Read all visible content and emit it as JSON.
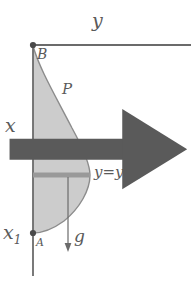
{
  "figure": {
    "background_color": "#ffffff",
    "ink_color": "#5a5a5a",
    "fill_color": "#cccccc",
    "bar_color": "#999999"
  },
  "labels": {
    "y_axis": "y",
    "x_axis": "x",
    "x_lower": "x",
    "x_lower_sub": "1",
    "point_b": "B",
    "point_a": "A",
    "curve_p": "P",
    "area_s": "S",
    "curve_equation": "y=y(x)",
    "gravity": "g"
  },
  "icons": {
    "gravity_vector_accent": "vector-arrow-icon",
    "gravity_arrow": "down-arrow-icon",
    "point_marker_a": "dot-marker-icon",
    "point_marker_b": "dot-marker-icon"
  },
  "geometry": {
    "origin": {
      "x": 33,
      "y": 45
    },
    "point_a": {
      "x": 33,
      "y": 233
    },
    "horizontal_axis": {
      "x1": 33,
      "y1": 45,
      "x2": 191,
      "y2": 45
    },
    "vertical_axis": {
      "x1": 33,
      "y1": 45,
      "x2": 33,
      "y2": 276
    },
    "chord_bar": {
      "x1": 33,
      "y1": 175,
      "x2": 89,
      "y2": 175,
      "thickness": 5
    },
    "gravity_arrow": {
      "x": 68,
      "y_start": 176,
      "y_end": 251
    },
    "curve_max_x": 90,
    "curve_max_x_at_y": 175
  }
}
